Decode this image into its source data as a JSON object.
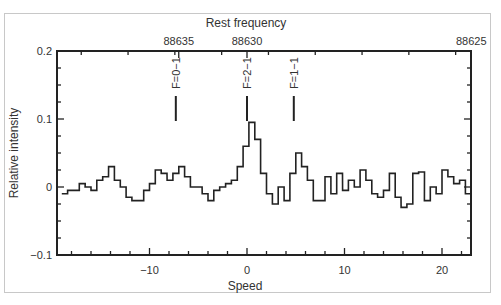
{
  "chart_data": {
    "type": "line",
    "subtype": "step-spectrum",
    "title": "",
    "xlabel": "Speed",
    "ylabel": "Relative intensity",
    "x2label": "Rest frequency",
    "xlim": [
      -19,
      23
    ],
    "ylim": [
      -0.1,
      0.2
    ],
    "x_ticks": [
      -10,
      0,
      10,
      20
    ],
    "x_tick_labels": [
      "−10",
      "0",
      "10",
      "20"
    ],
    "y_ticks": [
      -0.1,
      0,
      0.1,
      0.2
    ],
    "y_tick_labels": [
      "−0.1",
      "0",
      "0.1",
      "0.2"
    ],
    "x2_ticks": [
      88635,
      88630,
      88625
    ],
    "x2_tick_labels": [
      "88635",
      "88630",
      "88625"
    ],
    "x2_tick_positions_speed": [
      -7.0,
      0.0,
      23.0
    ],
    "grid": false,
    "legend": null,
    "annotations": [
      {
        "label": "F=0−1",
        "speed": -7.3
      },
      {
        "label": "F=2−1",
        "speed": 0.0
      },
      {
        "label": "F=1−1",
        "speed": 4.8
      }
    ],
    "series": [
      {
        "name": "spectrum",
        "x": [
          -19.0,
          -18.4,
          -17.8,
          -17.2,
          -16.6,
          -16.0,
          -15.4,
          -14.8,
          -14.2,
          -13.6,
          -13.0,
          -12.4,
          -11.8,
          -11.2,
          -10.6,
          -10.0,
          -9.4,
          -8.8,
          -8.2,
          -7.6,
          -7.0,
          -6.4,
          -5.8,
          -5.2,
          -4.6,
          -4.0,
          -3.4,
          -2.8,
          -2.2,
          -1.6,
          -1.0,
          -0.4,
          0.2,
          0.8,
          1.4,
          2.0,
          2.6,
          3.2,
          3.8,
          4.4,
          5.0,
          5.6,
          6.2,
          6.8,
          7.4,
          8.0,
          8.6,
          9.2,
          9.8,
          10.4,
          11.0,
          11.6,
          12.2,
          12.8,
          13.4,
          14.0,
          14.6,
          15.2,
          15.8,
          16.4,
          17.0,
          17.6,
          18.2,
          18.8,
          19.4,
          20.0,
          20.6,
          21.2,
          21.8,
          22.4
        ],
        "values": [
          -0.01,
          -0.005,
          -0.005,
          0.005,
          0.0,
          -0.005,
          0.01,
          0.015,
          0.03,
          0.01,
          0.0,
          -0.015,
          -0.02,
          -0.02,
          -0.005,
          0.005,
          0.025,
          0.02,
          0.01,
          0.02,
          0.03,
          0.015,
          0.0,
          0.0,
          -0.01,
          -0.02,
          -0.005,
          0.0,
          0.005,
          0.01,
          0.03,
          0.06,
          0.095,
          0.07,
          0.02,
          -0.01,
          -0.025,
          0.0,
          -0.02,
          0.02,
          0.05,
          0.03,
          0.01,
          -0.02,
          -0.02,
          0.015,
          -0.01,
          0.02,
          -0.005,
          0.01,
          0.0,
          0.025,
          0.01,
          -0.01,
          -0.015,
          -0.005,
          0.02,
          -0.015,
          -0.03,
          -0.025,
          0.02,
          0.022,
          -0.02,
          0.0,
          -0.01,
          0.025,
          0.015,
          0.005,
          0.01,
          -0.01
        ]
      }
    ]
  },
  "axes": {
    "bottom_title": "Speed",
    "top_title": "Rest frequency",
    "left_title": "Relative intensity"
  }
}
